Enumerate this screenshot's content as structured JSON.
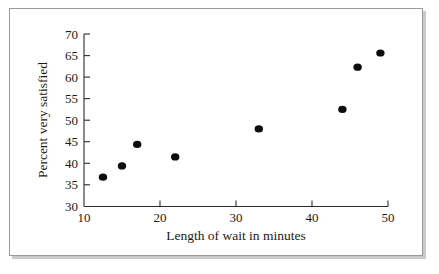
{
  "chart_data": {
    "type": "scatter",
    "title": "",
    "xlabel": "Length of wait in minutes",
    "ylabel": "Percent very satisfied",
    "xlim": [
      10,
      50
    ],
    "ylim": [
      30,
      70
    ],
    "xticks": [
      10,
      20,
      30,
      40,
      50
    ],
    "yticks": [
      30,
      35,
      40,
      45,
      50,
      55,
      60,
      65,
      70
    ],
    "xtick_labels": [
      "10",
      "20",
      "30",
      "40",
      "50"
    ],
    "ytick_labels": [
      "30",
      "35",
      "40",
      "45",
      "50",
      "55",
      "60",
      "65",
      "70"
    ],
    "grid": false,
    "legend": null,
    "marker_color": "#0d0d0d",
    "points": [
      {
        "x": 12.5,
        "y": 36.8
      },
      {
        "x": 15.0,
        "y": 39.4
      },
      {
        "x": 17.0,
        "y": 44.4
      },
      {
        "x": 22.0,
        "y": 41.5
      },
      {
        "x": 33.0,
        "y": 48.0
      },
      {
        "x": 44.0,
        "y": 52.5
      },
      {
        "x": 46.0,
        "y": 62.3
      },
      {
        "x": 49.0,
        "y": 65.6
      }
    ]
  },
  "axes": {
    "x_title": "Length of wait in minutes",
    "y_title": "Percent very satisfied"
  },
  "ticks": {
    "y": [
      "70",
      "65",
      "60",
      "55",
      "50",
      "45",
      "40",
      "35",
      "30"
    ],
    "x": [
      "10",
      "20",
      "30",
      "40",
      "50"
    ]
  }
}
